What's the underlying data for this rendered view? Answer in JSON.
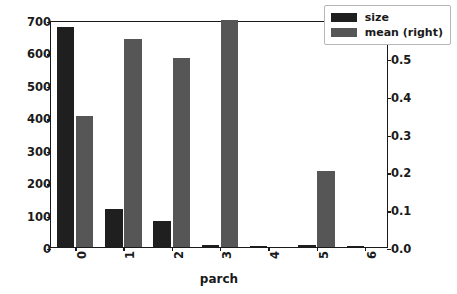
{
  "chart_data": {
    "type": "bar",
    "title": "",
    "xlabel": "parch",
    "ylabel": "",
    "categories": [
      "0",
      "1",
      "2",
      "3",
      "4",
      "5",
      "6"
    ],
    "series": [
      {
        "name": "size",
        "axis": "left",
        "color": "#1f1f1f",
        "values": [
          678,
          118,
          80,
          5,
          4,
          5,
          1
        ]
      },
      {
        "name": "mean (right)",
        "axis": "right",
        "color": "#565656",
        "values": [
          0.345,
          0.55,
          0.5,
          0.6,
          0.0,
          0.2,
          0.0
        ]
      }
    ],
    "left_axis": {
      "ticks": [
        0,
        100,
        200,
        300,
        400,
        500,
        600,
        700
      ],
      "tick_labels": [
        "0",
        "100",
        "200",
        "300",
        "400",
        "500",
        "600",
        "700"
      ],
      "ylim": [
        0,
        700
      ]
    },
    "right_axis": {
      "ticks": [
        0.0,
        0.1,
        0.2,
        0.3,
        0.4,
        0.5,
        0.6
      ],
      "tick_labels": [
        "0.0",
        "0.1",
        "0.2",
        "0.3",
        "0.4",
        "0.5",
        "0.6"
      ],
      "ylim": [
        0,
        0.6
      ]
    },
    "grid": false,
    "legend": {
      "position": "upper right",
      "entries": [
        "size",
        "mean (right)"
      ]
    }
  }
}
